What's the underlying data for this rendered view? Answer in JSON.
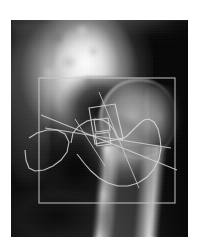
{
  "figure": {
    "title": "Hip radiograph with femoral neck geometry annotation",
    "caption": "",
    "modality": "X-ray",
    "anatomy": "Proximal femur / hip joint",
    "view": "Anteroposterior",
    "canvas": {
      "width": 198,
      "height": 248,
      "background": "#ffffff"
    },
    "image_panel": {
      "left": 11,
      "top": 20,
      "width": 177,
      "height": 217,
      "background": "#0a0a0a",
      "tone": "grayscale"
    }
  },
  "colors": {
    "page_background": "#ffffff",
    "film_dark": "#0a0a0a",
    "bone_bright": "#ffffff",
    "overlay_stroke": "#d5d5d5",
    "roi_stroke": "#c9c9c9",
    "contour_stroke": "#dcdcdc"
  },
  "annotations": {
    "roi_box": {
      "label": "region-of-interest-box",
      "x": 28,
      "y": 58,
      "width": 136,
      "height": 125,
      "stroke": "#c9c9c9"
    },
    "contour": {
      "label": "femoral-head-neck-contour",
      "points": "60,123 62,113 68,106 76,101 84,99 92,100 98,104 103,110 106,117 110,120 116,116 122,110 128,104 133,100 138,99 143,102 147,109 149,118 150,128 148,139 143,149 136,157 127,163 117,166 107,166 97,163 88,158 80,151 73,143 66,134"
    },
    "shaft_outline": {
      "label": "lesser-trochanter-outline",
      "points": "18,118 26,113 36,110 46,110 54,114 58,122 56,132 50,140 42,146 33,150 24,151 18,148 15,140 14,130"
    },
    "inner_quad": {
      "label": "neck-measurement-quadrilateral",
      "points": "78,88 104,84 112,118 84,124"
    },
    "small_box_upper": {
      "label": "inner-sample-box-upper",
      "points": "83,100 97,98 99,110 85,112"
    },
    "small_box_lower": {
      "label": "inner-sample-box-lower",
      "points": "84,114 98,112 100,124 86,126"
    },
    "neck_axis": {
      "label": "femoral-neck-axis-line",
      "x1": 30,
      "y1": 95,
      "x2": 166,
      "y2": 150
    },
    "neck_axis_2": {
      "label": "femoral-neck-axis-line-secondary",
      "x1": 34,
      "y1": 108,
      "x2": 160,
      "y2": 128
    },
    "head_diameter_line": {
      "label": "head-diameter-line",
      "x1": 88,
      "y1": 72,
      "x2": 128,
      "y2": 168
    },
    "cross_tick": {
      "label": "measurement-cross-tick",
      "x1": 64,
      "y1": 99,
      "x2": 94,
      "y2": 146
    }
  },
  "overlay_legend": {
    "items": [
      {
        "name": "roi-box",
        "description": "Region of interest bounding box"
      },
      {
        "name": "contour",
        "description": "Segmented femoral head and neck boundary"
      },
      {
        "name": "axis",
        "description": "Femoral neck axis measurement lines"
      }
    ]
  }
}
